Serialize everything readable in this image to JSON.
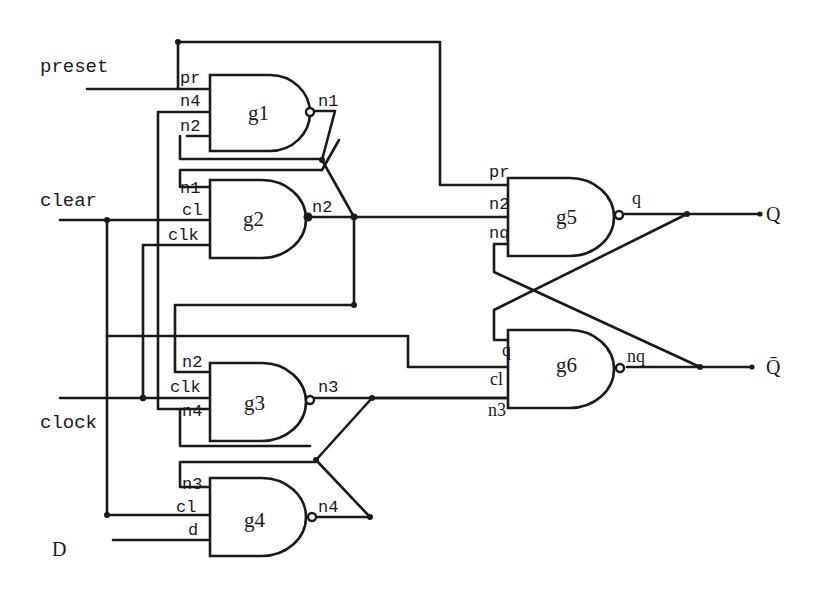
{
  "diagram": {
    "inputs": [
      {
        "id": "preset",
        "label": "preset"
      },
      {
        "id": "clear",
        "label": "clear"
      },
      {
        "id": "clock",
        "label": "clock"
      },
      {
        "id": "d",
        "label": "D"
      }
    ],
    "outputs": [
      {
        "id": "q",
        "label": "Q"
      },
      {
        "id": "qbar",
        "label": "Q̄"
      }
    ],
    "gates": [
      {
        "name": "g1",
        "output": "n1",
        "pins": [
          "pr",
          "n4",
          "n2"
        ]
      },
      {
        "name": "g2",
        "output": "n2",
        "pins": [
          "n1",
          "cl",
          "clk"
        ]
      },
      {
        "name": "g3",
        "output": "n3",
        "pins": [
          "n2",
          "clk",
          "n4"
        ]
      },
      {
        "name": "g4",
        "output": "n4",
        "pins": [
          "n3",
          "cl",
          "d"
        ]
      },
      {
        "name": "g5",
        "output": "q",
        "pins": [
          "pr",
          "n2",
          "nq"
        ]
      },
      {
        "name": "g6",
        "output": "nq",
        "pins": [
          "q",
          "cl",
          "n3"
        ]
      }
    ]
  }
}
